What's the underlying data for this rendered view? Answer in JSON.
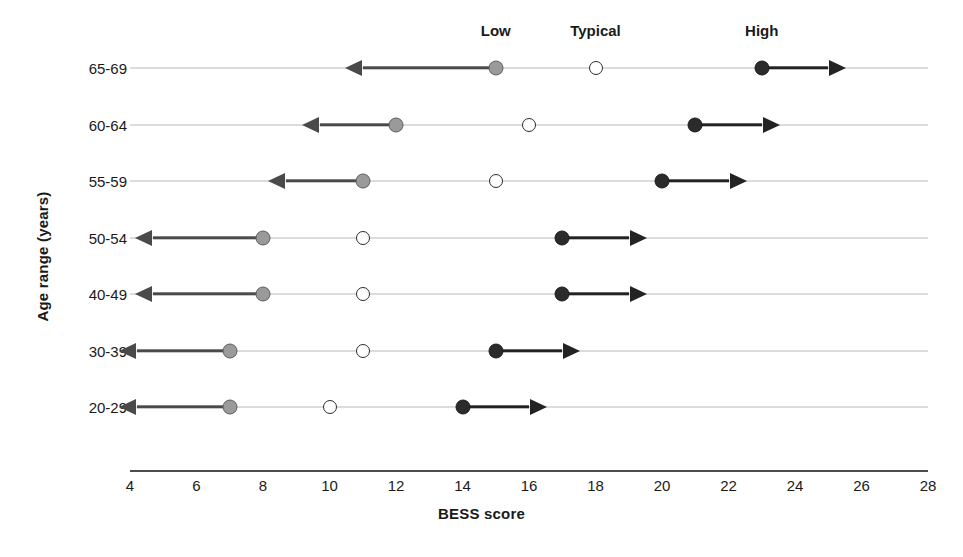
{
  "chart_data": {
    "type": "scatter",
    "title": "",
    "xlabel": "BESS score",
    "ylabel": "Age range (years)",
    "xlim": [
      4,
      28
    ],
    "xticks": [
      4,
      6,
      8,
      10,
      12,
      14,
      16,
      18,
      20,
      22,
      24,
      26,
      28
    ],
    "grid": false,
    "legend_position": "top",
    "legend": [
      "Low",
      "Typical",
      "High"
    ],
    "legend_positions_x": [
      15,
      18,
      23
    ],
    "categories": [
      "65-69",
      "60-64",
      "55-59",
      "50-54",
      "40-49",
      "30-39",
      "20-29"
    ],
    "series": [
      {
        "name": "Low",
        "values": [
          15,
          12,
          11,
          8,
          8,
          7,
          7
        ]
      },
      {
        "name": "Typical",
        "values": [
          18,
          16,
          15,
          11,
          11,
          11,
          10
        ]
      },
      {
        "name": "High",
        "values": [
          23,
          21,
          20,
          17,
          17,
          15,
          14
        ]
      }
    ],
    "low_arrow_ends": [
      11,
      9.7,
      8.7,
      4.7,
      4.7,
      4.2,
      4.2
    ],
    "high_arrow_ends": [
      25,
      23,
      22,
      19,
      19,
      17,
      16
    ],
    "rows": [
      {
        "label": "65-69",
        "low": 15,
        "typical": 18,
        "high": 23,
        "low_arrow_end": 11,
        "high_arrow_end": 25,
        "line_start": 4,
        "line_end": 28
      },
      {
        "label": "60-64",
        "low": 12,
        "typical": 16,
        "high": 21,
        "low_arrow_end": 9.7,
        "high_arrow_end": 23,
        "line_start": 4,
        "line_end": 28
      },
      {
        "label": "55-59",
        "low": 11,
        "typical": 15,
        "high": 20,
        "low_arrow_end": 8.7,
        "high_arrow_end": 22,
        "line_start": 4,
        "line_end": 28
      },
      {
        "label": "50-54",
        "low": 8,
        "typical": 11,
        "high": 17,
        "low_arrow_end": 4.7,
        "high_arrow_end": 19,
        "line_start": 4,
        "line_end": 28
      },
      {
        "label": "40-49",
        "low": 8,
        "typical": 11,
        "high": 17,
        "low_arrow_end": 4.7,
        "high_arrow_end": 19,
        "line_start": 4,
        "line_end": 28
      },
      {
        "label": "30-39",
        "low": 7,
        "typical": 11,
        "high": 15,
        "low_arrow_end": 4.2,
        "high_arrow_end": 17,
        "line_start": 4,
        "line_end": 28
      },
      {
        "label": "20-29",
        "low": 7,
        "typical": 10,
        "high": 14,
        "low_arrow_end": 4.2,
        "high_arrow_end": 16,
        "line_start": 4,
        "line_end": 28
      }
    ],
    "colors": {
      "low_marker": "#9a9a9a",
      "typical_marker": "#ffffff",
      "high_marker": "#2b2b2b",
      "low_arrow": "#4a4a4a",
      "high_arrow": "#232323",
      "row_line": "#b9b9b9",
      "axis": "#4d4d4d",
      "text": "#1a1a1a"
    }
  },
  "axis": {
    "x_title": "BESS score",
    "y_title": "Age range (years)",
    "x_tick_labels": [
      "4",
      "6",
      "8",
      "10",
      "12",
      "14",
      "16",
      "18",
      "20",
      "22",
      "24",
      "26",
      "28"
    ]
  },
  "legend": {
    "low": "Low",
    "typical": "Typical",
    "high": "High"
  },
  "rows_labels": [
    "65-69",
    "60-64",
    "55-59",
    "50-54",
    "40-49",
    "30-39",
    "20-29"
  ]
}
